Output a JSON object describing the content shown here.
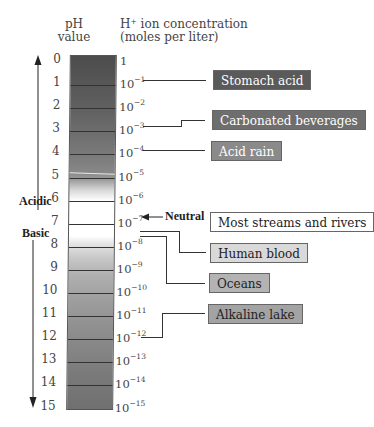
{
  "headers": {
    "ph_line1": "pH",
    "ph_line2": "value",
    "conc_line1": "H⁺ ion concentration",
    "conc_line2": "(moles per liter)"
  },
  "scale": {
    "ph_values": [
      "0",
      "1",
      "2",
      "3",
      "4",
      "5",
      "6",
      "7",
      "8",
      "9",
      "10",
      "11",
      "12",
      "13",
      "14",
      "15"
    ],
    "concentrations": [
      {
        "base": "1",
        "exp": ""
      },
      {
        "base": "10",
        "exp": "−1"
      },
      {
        "base": "10",
        "exp": "−2"
      },
      {
        "base": "10",
        "exp": "−3"
      },
      {
        "base": "10",
        "exp": "−4"
      },
      {
        "base": "10",
        "exp": "−5"
      },
      {
        "base": "10",
        "exp": "−6"
      },
      {
        "base": "10",
        "exp": "−7"
      },
      {
        "base": "10",
        "exp": "−8"
      },
      {
        "base": "10",
        "exp": "−9"
      },
      {
        "base": "10",
        "exp": "−10"
      },
      {
        "base": "10",
        "exp": "−11"
      },
      {
        "base": "10",
        "exp": "−12"
      },
      {
        "base": "10",
        "exp": "−13"
      },
      {
        "base": "10",
        "exp": "−14"
      },
      {
        "base": "10",
        "exp": "−15"
      }
    ]
  },
  "labels": {
    "acidic": "Acidic",
    "basic": "Basic",
    "neutral": "Neutral"
  },
  "examples": [
    {
      "label": "Stomach acid",
      "ph": "1",
      "bg": "#5a5a5a",
      "fg": "#ffffff"
    },
    {
      "label": "Carbonated beverages",
      "ph": "3",
      "bg": "#6e6e6e",
      "fg": "#ffffff"
    },
    {
      "label": "Acid rain",
      "ph": "4",
      "bg": "#8a8a8a",
      "fg": "#ffffff"
    },
    {
      "label": "Most streams and rivers",
      "ph": "7",
      "bg": "#ffffff",
      "fg": "#222222"
    },
    {
      "label": "Human blood",
      "ph": "7.4",
      "bg": "#d9d9d9",
      "fg": "#222222"
    },
    {
      "label": "Oceans",
      "ph": "8",
      "bg": "#b3b3b3",
      "fg": "#222222"
    },
    {
      "label": "Alkaline lake",
      "ph": "12",
      "bg": "#a3a3a3",
      "fg": "#222222"
    }
  ],
  "colors": {
    "bar_top": "#4f4f4f",
    "bar_neutral": "#ffffff",
    "bar_bottom": "#6a6a6a"
  }
}
